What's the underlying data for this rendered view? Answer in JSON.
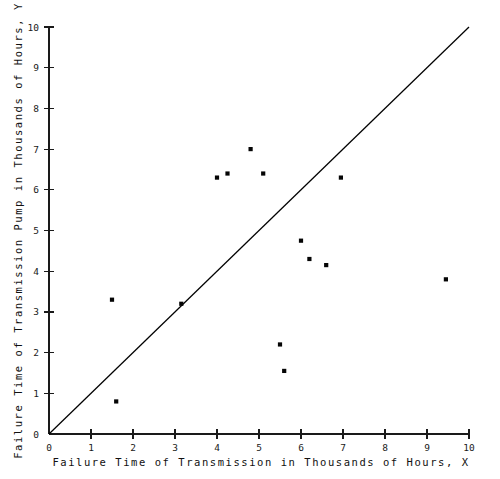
{
  "figure": {
    "background_color": "#ffffff",
    "ink_color": "#000000"
  },
  "axes": {
    "x_title": "Failure Time of Transmission in Thousands of Hours, X",
    "y_title": "Failure Time of Transmission Pump in Thousands of Hours, Y",
    "x_ticks": [
      "0",
      "1",
      "2",
      "3",
      "4",
      "5",
      "6",
      "7",
      "8",
      "9",
      "10"
    ],
    "y_ticks": [
      "0",
      "1",
      "2",
      "3",
      "4",
      "5",
      "6",
      "7",
      "8",
      "9",
      "10"
    ]
  },
  "chart_data": {
    "type": "scatter",
    "title": "",
    "xlabel": "Failure Time of Transmission in Thousands of Hours, X",
    "ylabel": "Failure Time of Transmission Pump in Thousands of Hours, Y",
    "xlim": [
      0,
      10
    ],
    "ylim": [
      0,
      10
    ],
    "xticks": [
      0,
      1,
      2,
      3,
      4,
      5,
      6,
      7,
      8,
      9,
      10
    ],
    "yticks": [
      0,
      1,
      2,
      3,
      4,
      5,
      6,
      7,
      8,
      9,
      10
    ],
    "grid": false,
    "legend": null,
    "marker": "square-dot",
    "marker_color": "#050505",
    "points": [
      {
        "x": 1.6,
        "y": 0.8
      },
      {
        "x": 1.5,
        "y": 3.3
      },
      {
        "x": 3.15,
        "y": 3.2
      },
      {
        "x": 4.0,
        "y": 6.3
      },
      {
        "x": 4.25,
        "y": 6.4
      },
      {
        "x": 4.8,
        "y": 7.0
      },
      {
        "x": 5.1,
        "y": 6.4
      },
      {
        "x": 5.5,
        "y": 2.2
      },
      {
        "x": 5.6,
        "y": 1.55
      },
      {
        "x": 6.0,
        "y": 4.75
      },
      {
        "x": 6.2,
        "y": 4.3
      },
      {
        "x": 6.6,
        "y": 4.15
      },
      {
        "x": 6.95,
        "y": 6.3
      },
      {
        "x": 9.45,
        "y": 3.8
      }
    ],
    "reference_line": {
      "name": "identity-line",
      "from": {
        "x": 0,
        "y": 0
      },
      "to": {
        "x": 10,
        "y": 10
      },
      "color": "#000000"
    }
  }
}
